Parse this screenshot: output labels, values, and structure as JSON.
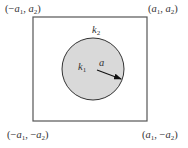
{
  "diagram": {
    "region": {
      "x1": 33,
      "y1": 17,
      "x2": 147,
      "y2": 121,
      "stroke": "#555555",
      "fill": "#ffffff"
    },
    "inclusion": {
      "cx": 93,
      "cy": 69,
      "r": 31,
      "fill": "#d9d9d9",
      "stroke": "#333333"
    },
    "radius_arrow": {
      "x1": 97,
      "y1": 70,
      "x2": 120,
      "y2": 79,
      "label": "a"
    },
    "corners": {
      "top_left": {
        "sign1": "(−",
        "var1": "a",
        "sub1": "1",
        "sep": ", ",
        "sign2": "",
        "var2": "a",
        "sub2": "2",
        "close": ")"
      },
      "top_right": {
        "sign1": "(",
        "var1": "a",
        "sub1": "1",
        "sep": ", ",
        "sign2": "",
        "var2": "a",
        "sub2": "2",
        "close": ")"
      },
      "bottom_left": {
        "sign1": "(−",
        "var1": "a",
        "sub1": "1",
        "sep": ", −",
        "sign2": "",
        "var2": "a",
        "sub2": "2",
        "close": ")"
      },
      "bottom_right": {
        "sign1": "(",
        "var1": "a",
        "sub1": "1",
        "sep": ", −",
        "sign2": "",
        "var2": "a",
        "sub2": "2",
        "close": ")"
      }
    },
    "labels": {
      "inner": {
        "var": "k",
        "sub": "1"
      },
      "outer": {
        "var": "k",
        "sub": "2"
      }
    }
  }
}
